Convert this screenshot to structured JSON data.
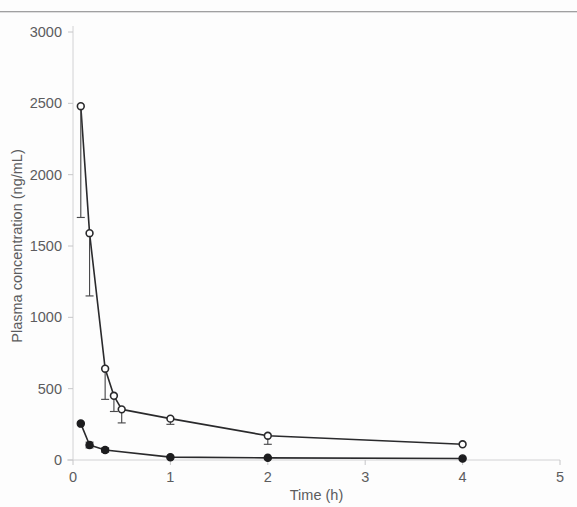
{
  "figure": {
    "background_color": "#fdfdfd",
    "line_color": "#2a2a2c",
    "text_color": "#5c5c5e",
    "axis_color": "#d2d2d4"
  },
  "chart_data": {
    "type": "line",
    "title": "",
    "xlabel": "Time (h)",
    "ylabel": "Plasma concentration (ng/mL)",
    "xlim": [
      0,
      5
    ],
    "ylim": [
      0,
      3000
    ],
    "xticks": [
      0,
      1,
      2,
      3,
      4,
      5
    ],
    "xtick_labels": [
      "0",
      "1",
      "2",
      "3",
      "4",
      "5"
    ],
    "yticks": [
      0,
      500,
      1000,
      1500,
      2000,
      2500,
      3000
    ],
    "ytick_labels": [
      "0",
      "500",
      "1000",
      "1500",
      "2000",
      "2500",
      "3000"
    ],
    "grid": false,
    "legend": "none",
    "error_bars": "standard deviation",
    "series": [
      {
        "name": "Open circle series",
        "marker": "open-circle",
        "x": [
          0.08,
          0.17,
          0.33,
          0.42,
          0.5,
          1.0,
          2.0,
          4.0
        ],
        "values": [
          2480,
          1590,
          640,
          450,
          355,
          290,
          170,
          110
        ],
        "err_low": [
          780,
          440,
          215,
          110,
          95,
          40,
          60,
          0
        ],
        "err_high": [
          0,
          0,
          0,
          0,
          0,
          0,
          0,
          0
        ]
      },
      {
        "name": "Filled circle series",
        "marker": "filled-circle",
        "x": [
          0.08,
          0.17,
          0.33,
          1.0,
          2.0,
          4.0
        ],
        "values": [
          255,
          105,
          70,
          20,
          15,
          10
        ],
        "err_low": [
          0,
          20,
          15,
          0,
          0,
          0
        ],
        "err_high": [
          0,
          20,
          15,
          0,
          0,
          0
        ]
      }
    ]
  }
}
